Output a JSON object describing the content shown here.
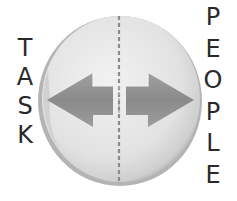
{
  "diagram": {
    "left_label": {
      "text": "TASK",
      "letters": [
        "T",
        "A",
        "S",
        "K"
      ]
    },
    "right_label": {
      "text": "PEOPLE",
      "letters": [
        "P",
        "E",
        "O",
        "P",
        "L",
        "E"
      ]
    },
    "disc": {
      "fill_light": "#ececec",
      "fill_mid": "#d8d8d8",
      "rim_dark": "#9a9a9a",
      "divider_style": "dashed",
      "divider_color": "#8a8a8a"
    },
    "arrows": [
      {
        "direction": "left",
        "points_to": "TASK",
        "color": "#8c8c8c"
      },
      {
        "direction": "right",
        "points_to": "PEOPLE",
        "color": "#8c8c8c"
      }
    ],
    "icons": [
      "double-arrow-icon",
      "disc-icon"
    ]
  }
}
